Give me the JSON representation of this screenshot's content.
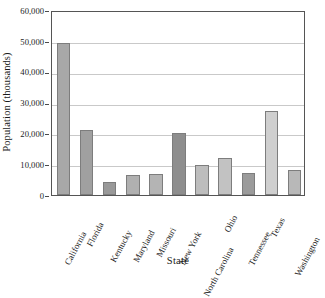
{
  "chart_data": {
    "type": "bar",
    "title": "",
    "xlabel": "State",
    "ylabel": "Population (thousands)",
    "categories": [
      "California",
      "Florida",
      "Kentucky",
      "Maryland",
      "Missouri",
      "New York",
      "North Carolina",
      "Ohio",
      "Tennessee",
      "Texas",
      "Washington"
    ],
    "values": [
      49400,
      21000,
      4300,
      6400,
      6700,
      20000,
      9700,
      12000,
      7100,
      27300,
      8000
    ],
    "bar_colors": [
      "#a8a8a8",
      "#a0a0a0",
      "#999999",
      "#b0b0b0",
      "#b4b4b4",
      "#8e8e8e",
      "#bdbdbd",
      "#c2c2c2",
      "#9b9b9b",
      "#cfcfcf",
      "#b8b8b8"
    ],
    "ylim": [
      0,
      60000
    ],
    "yticks": [
      0,
      10000,
      20000,
      30000,
      40000,
      50000,
      60000
    ],
    "ytick_labels": [
      "0",
      "10,000",
      "20,000",
      "30,000",
      "40,000",
      "50,000",
      "60,000"
    ],
    "grid": true,
    "grid_axis": "y",
    "legend": false
  },
  "figure": {
    "background_color": "#ffffff",
    "frame_color": "#555555",
    "gridline_color": "#c9c9c9",
    "text_color": "#1a1a1a"
  }
}
